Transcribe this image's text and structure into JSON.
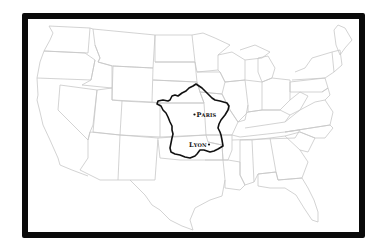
{
  "map": {
    "title": "France overlaid on the United States",
    "background_map": "united-states-state-borders",
    "overlay_country": "France",
    "frame_color": "#0a0a0a",
    "state_stroke_color": "#c8c8c8",
    "overlay_stroke_color": "#111111",
    "cities": [
      {
        "name": "Paris",
        "label": "Paris",
        "dot_side": "left"
      },
      {
        "name": "Lyon",
        "label": "Lyon",
        "dot_side": "right"
      }
    ]
  }
}
